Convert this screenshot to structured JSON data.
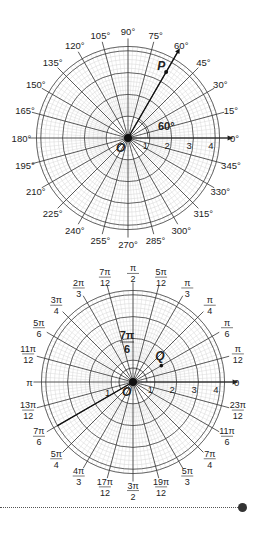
{
  "figure_top": {
    "title": "Polar grid in degrees",
    "center": [
      128,
      138
    ],
    "ring_radius_px": 21.8,
    "ring_labels": [
      "1",
      "2",
      "3",
      "4"
    ],
    "angle_labels": [
      "0°",
      "15°",
      "30°",
      "45°",
      "60°",
      "75°",
      "90°",
      "105°",
      "120°",
      "135°",
      "150°",
      "165°",
      "180°",
      "195°",
      "210°",
      "225°",
      "240°",
      "255°",
      "270°",
      "285°",
      "300°",
      "315°",
      "330°",
      "345°"
    ],
    "origin_label": "O",
    "point": {
      "label": "P",
      "r": 3.5,
      "angle_deg": 60
    },
    "angle_annotation": "60°"
  },
  "figure_bottom": {
    "title": "Polar grid in radians",
    "center": [
      133,
      382
    ],
    "ring_radius_px": 21.8,
    "ring_labels": [
      "1",
      "2",
      "3",
      "4"
    ],
    "angle_labels": [
      {
        "num": "0",
        "den": ""
      },
      {
        "num": "π",
        "den": "12"
      },
      {
        "num": "π",
        "den": "6"
      },
      {
        "num": "π",
        "den": "4"
      },
      {
        "num": "π",
        "den": "3"
      },
      {
        "num": "5π",
        "den": "12"
      },
      {
        "num": "π",
        "den": "2"
      },
      {
        "num": "7π",
        "den": "12"
      },
      {
        "num": "2π",
        "den": "3"
      },
      {
        "num": "3π",
        "den": "4"
      },
      {
        "num": "5π",
        "den": "6"
      },
      {
        "num": "11π",
        "den": "12"
      },
      {
        "num": "π",
        "den": ""
      },
      {
        "num": "13π",
        "den": "12"
      },
      {
        "num": "7π",
        "den": "6"
      },
      {
        "num": "5π",
        "den": "4"
      },
      {
        "num": "4π",
        "den": "3"
      },
      {
        "num": "17π",
        "den": "12"
      },
      {
        "num": "3π",
        "den": "2"
      },
      {
        "num": "19π",
        "den": "12"
      },
      {
        "num": "5π",
        "den": "3"
      },
      {
        "num": "7π",
        "den": "4"
      },
      {
        "num": "11π",
        "den": "6"
      },
      {
        "num": "23π",
        "den": "12"
      }
    ],
    "origin_label": "O",
    "point": {
      "label": "Q",
      "r": 1.5,
      "angle_deg": 30
    },
    "ray_angle_deg": 210,
    "ray_small_label": "1",
    "angle_annotation": {
      "num": "7π",
      "den": "6"
    }
  },
  "footer": {
    "divider": "dotted",
    "marker": "filled-circle"
  }
}
